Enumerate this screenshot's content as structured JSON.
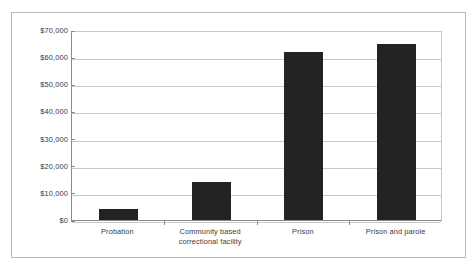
{
  "chart_data": {
    "type": "bar",
    "title": "",
    "subtitle": "",
    "xlabel": "",
    "ylabel": "",
    "categories": [
      "Probation",
      "Community based correctional facility",
      "Prison",
      "Prison and parole"
    ],
    "category_lines": [
      [
        "Probation"
      ],
      [
        "Community based",
        "correctional facility"
      ],
      [
        "Prison"
      ],
      [
        "Prison and parole"
      ]
    ],
    "values": [
      4000,
      14000,
      62000,
      65000
    ],
    "ylim": [
      0,
      70000
    ],
    "ytick_values": [
      0,
      10000,
      20000,
      30000,
      40000,
      50000,
      60000,
      70000
    ],
    "ytick_labels": [
      "$0",
      "$10,000",
      "$20,000",
      "$30,000",
      "$40,000",
      "$50,000",
      "$60,000",
      "$70,000"
    ],
    "grid": "horizontal",
    "legend": "none",
    "bar_color": "#232323",
    "gridline_color": "#c9c9c9",
    "axis_color": "#8a8a8a",
    "frame_color": "#b9b9b9",
    "background_color": "#ffffff"
  }
}
